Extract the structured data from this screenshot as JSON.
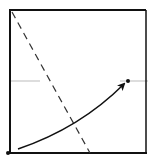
{
  "diagram": {
    "type": "origami-fold-step",
    "colors": {
      "background": "#ffffff",
      "paper_edge": "#111111",
      "crease_line": "#bbbbbb",
      "valley_fold": "#333333",
      "arrow": "#111111",
      "point": "#111111"
    },
    "paper_square": {
      "x": 9,
      "y": 10,
      "width": 137,
      "height": 143
    },
    "reference_crease": {
      "y": 81,
      "segments": [
        {
          "x1": 10,
          "x2": 40
        },
        {
          "x1": 120,
          "x2": 148
        }
      ]
    },
    "valley_fold_line": {
      "x1": 12,
      "y1": 12,
      "x2": 90,
      "y2": 153
    },
    "points": [
      {
        "name": "corner-point",
        "x": 8,
        "y": 153
      },
      {
        "name": "target-point",
        "x": 128,
        "y": 81
      }
    ],
    "fold_arrow": {
      "from": [
        18,
        149
      ],
      "control": [
        80,
        128
      ],
      "to": [
        124,
        84
      ]
    }
  }
}
